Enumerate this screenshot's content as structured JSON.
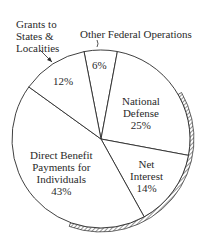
{
  "chart_data": {
    "type": "pie",
    "title": "",
    "start_angle_deg": -101,
    "direction": "clockwise",
    "center": [
      101,
      139
    ],
    "radius": 89,
    "slices": [
      {
        "label": "Other Federal Operations",
        "value": 6,
        "display": "6%"
      },
      {
        "label": "National Defense",
        "value": 25,
        "display": "25%"
      },
      {
        "label": "Net Interest",
        "value": 14,
        "display": "14%"
      },
      {
        "label": "Direct Benefit Payments for Individuals",
        "value": 43,
        "display": "43%"
      },
      {
        "label": "Grants to States & Localities",
        "value": 12,
        "display": "12%"
      }
    ],
    "hatched_rim": {
      "from_deg": -30,
      "to_deg": 110
    },
    "colors": {
      "fill": "#ffffff",
      "stroke": "#2a2a2a"
    }
  },
  "labels": {
    "grants": {
      "line1": "Grants to",
      "line2": "States &",
      "line3": "Localities",
      "pct": "12%"
    },
    "other": {
      "title": "Other Federal Operations",
      "pct": "6%"
    },
    "defense": {
      "line1": "National",
      "line2": "Defense",
      "pct": "25%"
    },
    "interest": {
      "line1": "Net",
      "line2": "Interest",
      "pct": "14%"
    },
    "direct": {
      "line1": "Direct Benefit",
      "line2": "Payments for",
      "line3": "Individuals",
      "pct": "43%"
    }
  }
}
